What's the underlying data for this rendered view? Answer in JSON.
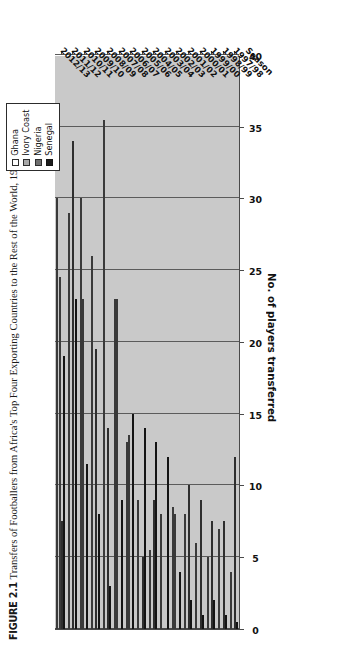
{
  "figure": {
    "number": "FIGURE 2.1",
    "caption": "Transfers of Footballers from Africa's Top Four Exporting Countries to the Rest of the World, 1997–2013"
  },
  "legend": {
    "position": "top-right",
    "items": [
      {
        "label": "Ghana",
        "key": "ghana",
        "color": "#ffffff"
      },
      {
        "label": "Ivory Coast",
        "key": "ivory",
        "color": "#a9a9a9"
      },
      {
        "label": "Nigeria",
        "key": "nigeria",
        "color": "#6e6e6e"
      },
      {
        "label": "Senegal",
        "key": "senegal",
        "color": "#1c1c1c"
      }
    ]
  },
  "axes": {
    "value_axis_title": "No. of players transferred",
    "category_axis_title": "Season",
    "value_ticks": [
      "0",
      "5",
      "10",
      "15",
      "20",
      "25",
      "30",
      "35",
      "40"
    ]
  },
  "chart_data": {
    "type": "bar",
    "orientation": "horizontal",
    "title": "Transfers of Footballers from Africa's Top Four Exporting Countries to the Rest of the World, 1997–2013",
    "xlabel": "Season",
    "ylabel": "No. of players transferred",
    "ylim": [
      0,
      40
    ],
    "ytick_step": 5,
    "grid": true,
    "legend_position": "top-right",
    "categories": [
      "1997/98",
      "1998/99",
      "1999/00",
      "2000/01",
      "2001/02",
      "2002/03",
      "2003/04",
      "2004/05",
      "2005/06",
      "2006/07",
      "2007/08",
      "2008/09",
      "2009/10",
      "2010/11",
      "2011/12",
      "2012/13"
    ],
    "series": [
      {
        "name": "Ghana",
        "color": "#ffffff",
        "values": [
          4,
          7,
          5,
          6,
          8,
          8.5,
          8,
          5.5,
          9,
          13,
          23,
          35.5,
          26,
          30,
          29,
          30
        ]
      },
      {
        "name": "Ivory Coast",
        "color": "#a9a9a9",
        "values": [
          0,
          0,
          0,
          0,
          0,
          8,
          0,
          0,
          0,
          13.5,
          23,
          0,
          0,
          23,
          0,
          24.5
        ]
      },
      {
        "name": "Nigeria",
        "color": "#6e6e6e",
        "values": [
          12,
          7.5,
          7.5,
          9,
          10,
          0,
          0,
          9,
          5,
          0,
          0,
          14,
          19.5,
          0,
          34,
          7.5
        ]
      },
      {
        "name": "Senegal",
        "color": "#1c1c1c",
        "values": [
          0.5,
          1,
          2,
          1,
          2,
          4,
          12,
          13,
          14,
          15,
          9,
          3,
          8,
          11.5,
          23,
          19
        ]
      }
    ]
  },
  "colors": {
    "plot_background": "#c9c9c9",
    "gridline": "#5b5b5b",
    "axis": "#4a4a4a",
    "page_background": "#ffffff"
  }
}
